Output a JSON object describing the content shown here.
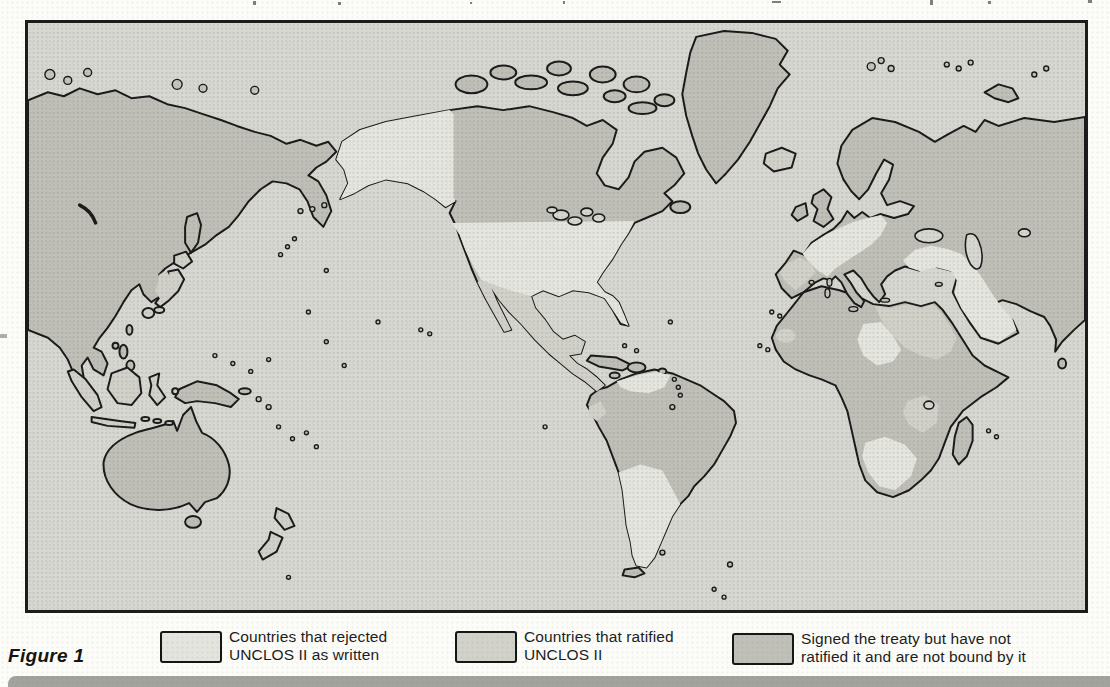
{
  "figure": {
    "label": "Figure 1"
  },
  "legend": {
    "items": [
      {
        "id": "rejected",
        "line1": "Countries that rejected",
        "line2": "UNCLOS II as written",
        "swatch_color": "#e4e4de"
      },
      {
        "id": "ratified",
        "line1": "Countries that ratified",
        "line2": "UNCLOS II",
        "swatch_color": "#d2d2cb"
      },
      {
        "id": "signed_not_ratified",
        "line1": "Signed the treaty but have not",
        "line2": "ratified it and are not bound by it",
        "swatch_color": "#c0c0b9"
      }
    ]
  },
  "map": {
    "type": "choropleth-world-map",
    "projection": "pacific-centered",
    "ocean_color": "#d8d8d3",
    "outline_color": "#1a1a1a",
    "bottom_bar_color": "#a3a39e",
    "category_colors": {
      "rejected": "#e6e6e0",
      "ratified": "#d2d2cb",
      "signed_not_ratified": "#c0c0b9"
    },
    "regions": [
      {
        "name": "soviet-union-east-asia",
        "category": "signed_not_ratified"
      },
      {
        "name": "japan",
        "category": "ratified"
      },
      {
        "name": "korea",
        "category": "ratified"
      },
      {
        "name": "indonesia",
        "category": "ratified"
      },
      {
        "name": "new-guinea",
        "category": "signed_not_ratified"
      },
      {
        "name": "australia",
        "category": "signed_not_ratified"
      },
      {
        "name": "new-zealand",
        "category": "ratified"
      },
      {
        "name": "alaska",
        "category": "rejected"
      },
      {
        "name": "united-states",
        "category": "rejected"
      },
      {
        "name": "canada",
        "category": "signed_not_ratified"
      },
      {
        "name": "greenland",
        "category": "signed_not_ratified"
      },
      {
        "name": "mexico-central-america",
        "category": "ratified"
      },
      {
        "name": "caribbean-islands",
        "category": "signed_not_ratified"
      },
      {
        "name": "venezuela",
        "category": "rejected"
      },
      {
        "name": "brazil-andean-south-america",
        "category": "signed_not_ratified"
      },
      {
        "name": "ecuador",
        "category": "ratified"
      },
      {
        "name": "argentina-chile",
        "category": "rejected"
      },
      {
        "name": "iceland",
        "category": "ratified"
      },
      {
        "name": "british-isles",
        "category": "signed_not_ratified"
      },
      {
        "name": "scandinavia",
        "category": "signed_not_ratified"
      },
      {
        "name": "france-germany",
        "category": "rejected"
      },
      {
        "name": "iberia",
        "category": "ratified"
      },
      {
        "name": "eastern-europe-ussr-west",
        "category": "signed_not_ratified"
      },
      {
        "name": "turkey-middle-east-arabia",
        "category": "rejected"
      },
      {
        "name": "iran-india-south-asia",
        "category": "signed_not_ratified"
      },
      {
        "name": "northwest-africa",
        "category": "signed_not_ratified"
      },
      {
        "name": "libya-egypt-sudan",
        "category": "ratified"
      },
      {
        "name": "central-africa-patch",
        "category": "rejected"
      },
      {
        "name": "east-africa-patch",
        "category": "ratified"
      },
      {
        "name": "southern-africa",
        "category": "rejected"
      },
      {
        "name": "madagascar",
        "category": "signed_not_ratified"
      }
    ]
  }
}
